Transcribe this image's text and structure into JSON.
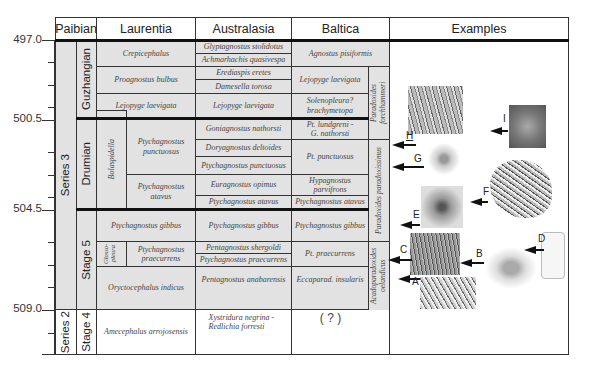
{
  "headers": {
    "paibian": "Paibian",
    "laurentia": "Laurentia",
    "australasia": "Australasia",
    "baltica": "Baltica",
    "examples": "Examples"
  },
  "age_axis": {
    "labels": [
      "497.0",
      "500.5",
      "504.5",
      "509.0"
    ]
  },
  "chronostratigraphy": {
    "series": [
      "Series 3",
      "Series 2"
    ],
    "stages": [
      "Guzhangian",
      "Drumian",
      "Stage 5",
      "Stage 4"
    ]
  },
  "laurentia": {
    "zones": [
      "Crepicephalus",
      "Proagnostus bulbus",
      "Lejopyge laevigata",
      "Bolaspidella",
      "Ptychagnostus punctuosus",
      "Ptychagnostus atavus",
      "Ptychagnostus gibbus",
      "Glosso-pleura",
      "Ptychagnostus praecurrens",
      "Oryctocephalus indicus",
      "Amecephalus arrojosensis"
    ]
  },
  "australasia": {
    "zones": [
      "Glyptagnostus stolidotus",
      "Achmarhachis quasivespa",
      "Erediaspis eretes",
      "Damesella torosa",
      "Lejopyge laevigata",
      "Goniagnostus nathorsti",
      "Doryagnostus deltoides",
      "Ptychagnostus punctuosus",
      "Euragnostus opimus",
      "Ptychagnostus atavus",
      "Ptychagnostus gibbus",
      "Pentagnostus shergoldi",
      "Ptychagnostus praecurrens",
      "Pentagnostus anabarensis",
      "Xystridura negrina - Redlichia forresti"
    ]
  },
  "baltica": {
    "zones": [
      "Agnostus pisiformis",
      "Lejopyge laevigata",
      "Solenopleura? brachymetopa",
      "Pt. lundgreni - G. nathorsti",
      "Pt. punctuosus",
      "Hypagnostus parvifrons",
      "Ptychagnostus atavus",
      "Ptychagnostus gibbus",
      "Pt. praecurrens",
      "Eccaparad. insularis",
      "( ? )"
    ],
    "superzones": [
      "Paradoxides forchhammeri",
      "Paradoxides paradoxissimus",
      "Acadoparadoxides oelandicus"
    ]
  },
  "examples": {
    "labels": [
      "A",
      "B",
      "C",
      "D",
      "E",
      "F",
      "G",
      "H",
      "I"
    ]
  }
}
